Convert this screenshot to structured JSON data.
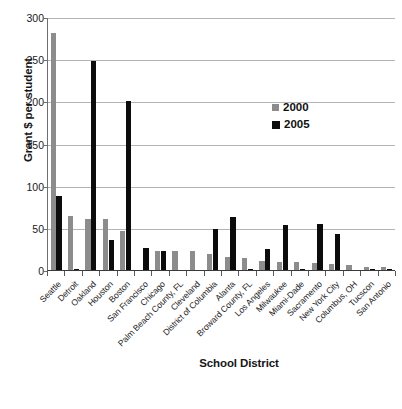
{
  "chart_data": {
    "type": "bar",
    "title": "",
    "xlabel": "School District",
    "ylabel": "Grant $ per student",
    "ylim": [
      0,
      300
    ],
    "yticks": [
      0,
      50,
      100,
      150,
      200,
      250,
      300
    ],
    "grid": true,
    "legend_position": "upper-right",
    "categories": [
      "Seattle",
      "Detroit",
      "Oakland",
      "Houston",
      "Boston",
      "San Francisco",
      "Chicago",
      "Palm Beach County, FL",
      "Cleveland",
      "District of Columbia",
      "Alanta",
      "Broward County, FL",
      "Los Angeles",
      "Milwaukee",
      "Miami-Dade",
      "Sacramento",
      "New York City",
      "Columbus, OH",
      "Tucscon",
      "San Antonio"
    ],
    "series": [
      {
        "name": "2000",
        "color": "#8c8c8c",
        "values": [
          281,
          64,
          61,
          61,
          46,
          0,
          22,
          22,
          22,
          19,
          15,
          14,
          11,
          9,
          9,
          8,
          7,
          6,
          4,
          4
        ]
      },
      {
        "name": "2005",
        "color": "#0c0c0c",
        "values": [
          88,
          1,
          248,
          36,
          201,
          26,
          23,
          0,
          0,
          49,
          63,
          1,
          25,
          53,
          1,
          54,
          43,
          0,
          1,
          1
        ]
      }
    ]
  },
  "axes": {
    "y_tick_labels": [
      "300",
      "250",
      "200",
      "150",
      "100",
      "50",
      "0"
    ],
    "y_title": "Grant $ per student",
    "x_title": "School District"
  },
  "legend": {
    "items": [
      {
        "label": "2000",
        "swatch": "legend-swatch-2000",
        "color": "#8c8c8c"
      },
      {
        "label": "2005",
        "swatch": "legend-swatch-2005",
        "color": "#0c0c0c"
      }
    ]
  }
}
